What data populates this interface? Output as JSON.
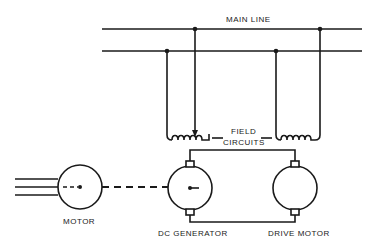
{
  "diagram": {
    "labels": {
      "main_line": "MAIN LINE",
      "field_circuits_1": "FIELD",
      "field_circuits_2": "CIRCUITS",
      "motor": "MOTOR",
      "dc_generator": "DC GENERATOR",
      "drive_motor": "DRIVE MOTOR"
    },
    "colors": {
      "line": "#1a1a1a",
      "background": "#ffffff"
    }
  }
}
